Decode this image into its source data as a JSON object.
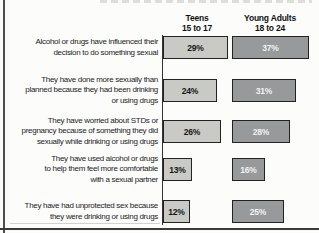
{
  "header": {
    "teens": {
      "line1": "Teens",
      "line2": "15 to 17"
    },
    "young_adults": {
      "line1": "Young Adults",
      "line2": "18 to 24"
    }
  },
  "chart_data": {
    "type": "bar",
    "orientation": "horizontal",
    "value_suffix": "%",
    "xlim": [
      0,
      45
    ],
    "grid": false,
    "legend_position": "column-headers-top",
    "categories": [
      "Alcohol or drugs have influenced their decision to do something sexual",
      "They have done more sexually than planned because they had been drinking or using drugs",
      "They have worried about STDs or pregnancy because of something they did sexually while drinking or using drugs",
      "They have used alcohol or drugs to help them feel more comfortable with a sexual partner",
      "They have had unprotected sex because they were drinking or using drugs"
    ],
    "category_lines": [
      [
        "Alcohol or drugs have influenced their",
        "decision to do something sexual"
      ],
      [
        "They have done more sexually than",
        "planned because they had been drinking",
        "or using drugs"
      ],
      [
        "They have worried about STDs or",
        "pregnancy because of something they did",
        "sexually while drinking or using drugs"
      ],
      [
        "They have used alcohol or drugs",
        "to help them feel more comfortable",
        "with a sexual partner"
      ],
      [
        "They have had unprotected sex because",
        "they were drinking or using drugs"
      ]
    ],
    "series": [
      {
        "name": "Teens 15 to 17",
        "values": [
          29,
          24,
          26,
          13,
          12
        ],
        "bar_color": "#c9cac5",
        "label_color": "#161616"
      },
      {
        "name": "Young Adults 18 to 24",
        "values": [
          37,
          31,
          28,
          16,
          25
        ],
        "bar_color": "#97999b",
        "label_color": "#f2f2f2"
      }
    ],
    "bar_border_color": "#222222"
  },
  "colors": {
    "background": "#fcfcfb",
    "page_edge_line": "#4d4d4d",
    "bottom_rule": "#3a3a3a",
    "axis_line": "#333333",
    "label_text": "#1b1b1b"
  }
}
